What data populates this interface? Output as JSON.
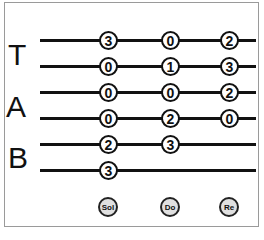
{
  "tab": {
    "labels": [
      "T",
      "A",
      "B"
    ],
    "strings": 6,
    "chords": [
      {
        "name": "Sol",
        "frets": [
          "3",
          "0",
          "0",
          "0",
          "2",
          "3"
        ]
      },
      {
        "name": "Do",
        "frets": [
          "0",
          "1",
          "0",
          "2",
          "3",
          null
        ]
      },
      {
        "name": "Re",
        "frets": [
          "2",
          "3",
          "2",
          "0",
          null,
          null
        ]
      }
    ]
  }
}
